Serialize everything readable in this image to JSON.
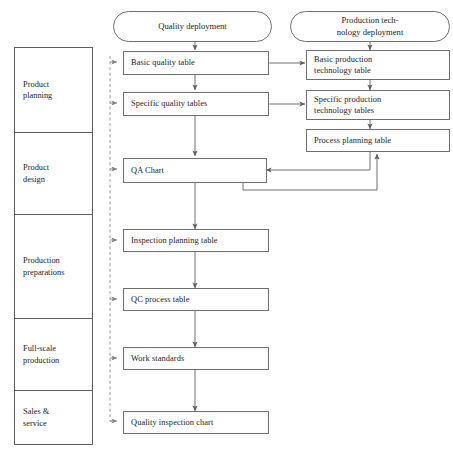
{
  "diagram": {
    "colors": {
      "stroke": "#6e6e6e",
      "text": "#1b1b1b",
      "background": "#ffffff",
      "dashed_stroke": "#8a8a8a"
    },
    "banners": [
      {
        "id": "quality-deployment",
        "label": "Quality deployment"
      },
      {
        "id": "production-technology-deployment",
        "label": "Production tech-\nnology deployment"
      }
    ],
    "phases": [
      {
        "id": "product-planning",
        "label": "Product\nplanning"
      },
      {
        "id": "product-design",
        "label": "Product\ndesign"
      },
      {
        "id": "production-preparations",
        "label": "Production\npreparations"
      },
      {
        "id": "full-scale-production",
        "label": "Full-scale\nproduction"
      },
      {
        "id": "sales-service",
        "label": "Sales &\nservice"
      }
    ],
    "quality_nodes": [
      {
        "id": "basic-quality-table",
        "label": "Basic quality table"
      },
      {
        "id": "specific-quality-tables",
        "label": "Specific quality tables"
      },
      {
        "id": "qa-chart",
        "label": "QA Chart"
      },
      {
        "id": "inspection-planning-table",
        "label": "Inspection planning table"
      },
      {
        "id": "qc-process-table",
        "label": "QC process table"
      },
      {
        "id": "work-standards",
        "label": "Work standards"
      },
      {
        "id": "quality-inspection-chart",
        "label": "Quality inspection chart"
      }
    ],
    "technology_nodes": [
      {
        "id": "basic-production-technology-table",
        "label": "Basic production\ntechnology table"
      },
      {
        "id": "specific-production-technology-tables",
        "label": "Specific production\ntechnology tables"
      },
      {
        "id": "process-planning-table",
        "label": "Process planning table"
      }
    ],
    "connections": [
      {
        "from": "basic-quality-table",
        "to": "specific-quality-tables",
        "style": "solid",
        "arrow": "single"
      },
      {
        "from": "specific-quality-tables",
        "to": "qa-chart",
        "style": "solid",
        "arrow": "single"
      },
      {
        "from": "qa-chart",
        "to": "inspection-planning-table",
        "style": "solid",
        "arrow": "single"
      },
      {
        "from": "inspection-planning-table",
        "to": "qc-process-table",
        "style": "solid",
        "arrow": "single"
      },
      {
        "from": "qc-process-table",
        "to": "work-standards",
        "style": "solid",
        "arrow": "single"
      },
      {
        "from": "work-standards",
        "to": "quality-inspection-chart",
        "style": "solid",
        "arrow": "single"
      },
      {
        "from": "basic-production-technology-table",
        "to": "specific-production-technology-tables",
        "style": "solid",
        "arrow": "single"
      },
      {
        "from": "specific-production-technology-tables",
        "to": "process-planning-table",
        "style": "solid",
        "arrow": "single"
      },
      {
        "from": "basic-quality-table",
        "to": "basic-production-technology-table",
        "style": "solid",
        "arrow": "double"
      },
      {
        "from": "specific-quality-tables",
        "to": "specific-production-technology-tables",
        "style": "solid",
        "arrow": "double"
      },
      {
        "from": "process-planning-table",
        "to": "qa-chart",
        "style": "solid",
        "arrow": "single"
      },
      {
        "from": "qa-chart",
        "to": "process-planning-table",
        "style": "solid",
        "arrow": "single"
      },
      {
        "from": "quality-inspection-chart",
        "to": "all-quality-nodes",
        "style": "dashed",
        "arrow": "single"
      }
    ]
  }
}
